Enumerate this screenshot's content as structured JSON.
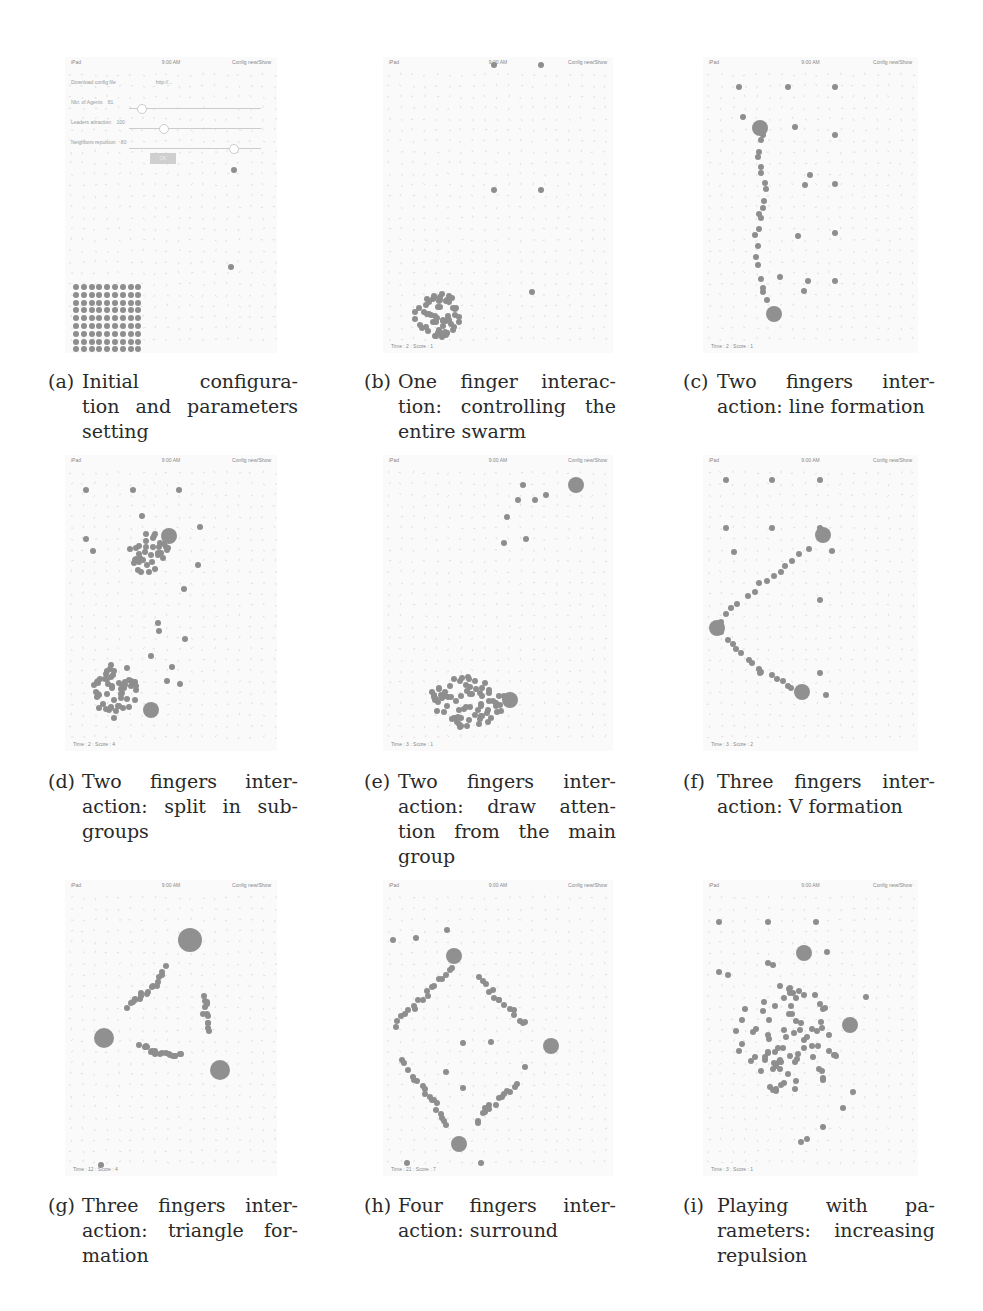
{
  "figure": {
    "panels": [
      {
        "id": "a",
        "label": "(a)",
        "caption": "Initial configuration and parameters setting",
        "caption_lines": [
          "Initial configura-",
          "tion and parameters",
          "setting"
        ],
        "status": {
          "left": "iPad",
          "center": "9:00 AM",
          "right": "Config new/Show"
        },
        "footer": "",
        "form": {
          "rows": [
            "Download config file",
            "Nbr. of Agents",
            "Leaders attraction",
            "Neighbors repulsion"
          ],
          "url": "http://...",
          "values": [
            "81",
            "100",
            "80"
          ],
          "ok_label": "OK"
        },
        "dots": [
          [
            169,
            113
          ],
          [
            166,
            210
          ]
        ],
        "grid": {
          "x": 8,
          "y": 227,
          "cols": 9,
          "rows": 9,
          "step": 7.8
        }
      },
      {
        "id": "b",
        "label": "(b)",
        "caption": "One finger interaction: controlling the entire swarm",
        "caption_lines": [
          "One finger interac-",
          "tion: controlling the",
          "entire swarm"
        ],
        "status": {
          "left": "iPad",
          "center": "9:00 AM",
          "right": "Config new/Show"
        },
        "footer": "Time : 2 : Score : 1",
        "dots": [
          [
            111,
            8
          ],
          [
            158,
            8
          ],
          [
            111,
            133
          ],
          [
            158,
            133
          ],
          [
            149,
            235
          ]
        ],
        "cluster": {
          "cx": 55,
          "cy": 258,
          "rx": 24,
          "ry": 22,
          "n": 60
        }
      },
      {
        "id": "c",
        "label": "(c)",
        "caption": "Two fingers interaction: line formation",
        "caption_lines": [
          "Two fingers inter-",
          "action: line formation"
        ],
        "status": {
          "left": "iPad",
          "center": "9:00 AM",
          "right": "Config new/Show"
        },
        "footer": "Time : 2 : Score : 1",
        "dots": [
          [
            36,
            30
          ],
          [
            85,
            30
          ],
          [
            132,
            30
          ],
          [
            40,
            60
          ],
          [
            92,
            70
          ],
          [
            132,
            78
          ],
          [
            107,
            118
          ],
          [
            132,
            127
          ],
          [
            102,
            128
          ],
          [
            95,
            179
          ],
          [
            132,
            176
          ],
          [
            77,
            220
          ],
          [
            105,
            224
          ],
          [
            132,
            224
          ],
          [
            101,
            234
          ]
        ],
        "big": [
          [
            57,
            71,
            8
          ],
          [
            71,
            257,
            8
          ]
        ],
        "line": [
          [
            58,
            78
          ],
          [
            56,
            100
          ],
          [
            62,
            125
          ],
          [
            58,
            150
          ],
          [
            54,
            170
          ],
          [
            52,
            200
          ],
          [
            58,
            230
          ],
          [
            68,
            252
          ]
        ]
      },
      {
        "id": "d",
        "label": "(d)",
        "caption": "Two fingers interaction: split in subgroups",
        "caption_lines": [
          "Two fingers inter-",
          "action: split in sub-",
          "groups"
        ],
        "status": {
          "left": "iPad",
          "center": "9:00 AM",
          "right": "Config new/Show"
        },
        "footer": "Time : 2 : Score : 4",
        "dots": [
          [
            21,
            35
          ],
          [
            68,
            35
          ],
          [
            114,
            35
          ],
          [
            77,
            61
          ],
          [
            135,
            72
          ],
          [
            21,
            84
          ],
          [
            28,
            96
          ],
          [
            133,
            110
          ],
          [
            119,
            134
          ],
          [
            93,
            168
          ],
          [
            94,
            176
          ],
          [
            120,
            184
          ],
          [
            86,
            201
          ],
          [
            107,
            212
          ],
          [
            102,
            226
          ],
          [
            115,
            229
          ]
        ],
        "big": [
          [
            104,
            81,
            8
          ],
          [
            86,
            255,
            8
          ]
        ],
        "clusters": [
          {
            "cx": 85,
            "cy": 98,
            "rx": 20,
            "ry": 22,
            "n": 35
          },
          {
            "cx": 50,
            "cy": 235,
            "rx": 22,
            "ry": 30,
            "n": 55
          }
        ]
      },
      {
        "id": "e",
        "label": "(e)",
        "caption": "Two fingers interaction: draw attention from the main group",
        "caption_lines": [
          "Two fingers inter-",
          "action: draw atten-",
          "tion from the main",
          "group"
        ],
        "status": {
          "left": "iPad",
          "center": "9:00 AM",
          "right": "Config new/Show"
        },
        "footer": "Time : 3 : Score : 1",
        "dots": [
          [
            135,
            45
          ],
          [
            152,
            45
          ],
          [
            163,
            40
          ],
          [
            140,
            30
          ],
          [
            124,
            62
          ],
          [
            121,
            88
          ],
          [
            143,
            84
          ]
        ],
        "big": [
          [
            193,
            30,
            8
          ],
          [
            127,
            245,
            8
          ]
        ],
        "cluster": {
          "cx": 85,
          "cy": 245,
          "rx": 38,
          "ry": 28,
          "n": 75
        }
      },
      {
        "id": "f",
        "label": "(f)",
        "caption": "Three fingers interaction: V formation",
        "caption_lines": [
          "Three fingers inter-",
          "action: V formation"
        ],
        "status": {
          "left": "iPad",
          "center": "9:00 AM",
          "right": "Config new/Show"
        },
        "footer": "Time : 3 : Score : 2",
        "dots": [
          [
            23,
            25
          ],
          [
            69,
            25
          ],
          [
            117,
            25
          ],
          [
            23,
            73
          ],
          [
            69,
            73
          ],
          [
            117,
            73
          ],
          [
            31,
            97
          ],
          [
            117,
            145
          ],
          [
            129,
            96
          ],
          [
            57,
            218
          ],
          [
            123,
            240
          ],
          [
            117,
            218
          ]
        ],
        "big": [
          [
            120,
            80,
            8
          ],
          [
            14,
            173,
            8
          ],
          [
            99,
            237,
            8
          ]
        ],
        "line": [
          [
            14,
            173
          ],
          [
            30,
            155
          ],
          [
            50,
            135
          ],
          [
            70,
            120
          ],
          [
            90,
            105
          ],
          [
            112,
            88
          ]
        ],
        "line2": [
          [
            14,
            173
          ],
          [
            30,
            190
          ],
          [
            45,
            205
          ],
          [
            60,
            218
          ],
          [
            80,
            228
          ],
          [
            95,
            235
          ]
        ]
      },
      {
        "id": "g",
        "label": "(g)",
        "caption": "Three fingers interaction: triangle formation",
        "caption_lines": [
          "Three fingers inter-",
          "action: triangle for-",
          "mation"
        ],
        "status": {
          "left": "iPad",
          "center": "9:00 AM",
          "right": "Config new/Show"
        },
        "footer": "Time : 12 : Score : 4",
        "dots": [
          [
            36,
            285
          ]
        ],
        "big": [
          [
            125,
            60,
            12
          ],
          [
            39,
            158,
            10
          ],
          [
            155,
            190,
            10
          ]
        ],
        "line": [
          [
            100,
            87
          ],
          [
            95,
            98
          ],
          [
            88,
            107
          ],
          [
            80,
            113
          ],
          [
            75,
            118
          ],
          [
            68,
            122
          ],
          [
            62,
            128
          ]
        ],
        "line2": [
          [
            138,
            118
          ],
          [
            140,
            126
          ],
          [
            141,
            136
          ],
          [
            142,
            144
          ],
          [
            146,
            151
          ]
        ],
        "line3": [
          [
            76,
            166
          ],
          [
            84,
            168
          ],
          [
            90,
            171
          ],
          [
            97,
            174
          ],
          [
            105,
            175
          ],
          [
            112,
            175
          ],
          [
            120,
            177
          ]
        ]
      },
      {
        "id": "h",
        "label": "(h)",
        "caption": "Four fingers interaction: surround",
        "caption_lines": [
          "Four fingers inter-",
          "action: surround"
        ],
        "status": {
          "left": "iPad",
          "center": "9:00 AM",
          "right": "Config new/Show"
        },
        "footer": "Time : 21 : Score : 7",
        "dots": [
          [
            10,
            60
          ],
          [
            33,
            58
          ],
          [
            64,
            50
          ],
          [
            80,
            163
          ],
          [
            108,
            162
          ],
          [
            63,
            192
          ],
          [
            80,
            208
          ],
          [
            98,
            283
          ],
          [
            24,
            283
          ],
          [
            142,
            187
          ]
        ],
        "big": [
          [
            71,
            76,
            8
          ],
          [
            168,
            166,
            8
          ],
          [
            76,
            264,
            8
          ]
        ],
        "line": [
          [
            68,
            88
          ],
          [
            60,
            98
          ],
          [
            50,
            108
          ],
          [
            40,
            118
          ],
          [
            30,
            128
          ],
          [
            20,
            138
          ],
          [
            8,
            150
          ]
        ],
        "line2": [
          [
            97,
            98
          ],
          [
            105,
            110
          ],
          [
            115,
            118
          ],
          [
            125,
            128
          ],
          [
            138,
            140
          ],
          [
            145,
            143
          ]
        ],
        "line3": [
          [
            20,
            180
          ],
          [
            30,
            195
          ],
          [
            38,
            205
          ],
          [
            45,
            215
          ],
          [
            52,
            225
          ],
          [
            60,
            238
          ],
          [
            66,
            250
          ]
        ],
        "line4": [
          [
            135,
            205
          ],
          [
            125,
            213
          ],
          [
            115,
            220
          ],
          [
            105,
            228
          ],
          [
            100,
            235
          ],
          [
            90,
            248
          ]
        ]
      },
      {
        "id": "i",
        "label": "(i)",
        "caption": "Playing with parameters: increasing repulsion",
        "caption_lines": [
          "Playing with pa-",
          "rameters: increasing",
          "repulsion"
        ],
        "status": {
          "left": "iPad",
          "center": "9:00 AM",
          "right": "Config new/Show"
        },
        "footer": "Time : 3 : Score : 1",
        "dots": [
          [
            16,
            42
          ],
          [
            65,
            42
          ],
          [
            113,
            42
          ],
          [
            124,
            72
          ],
          [
            65,
            83
          ],
          [
            70,
            85
          ],
          [
            16,
            92
          ],
          [
            25,
            95
          ],
          [
            163,
            117
          ],
          [
            150,
            212
          ],
          [
            140,
            228
          ],
          [
            120,
            247
          ],
          [
            98,
            262
          ],
          [
            104,
            259
          ]
        ],
        "big": [
          [
            101,
            73,
            8
          ],
          [
            147,
            145,
            8
          ]
        ],
        "cluster": {
          "cx": 85,
          "cy": 160,
          "rx": 55,
          "ry": 55,
          "n": 85
        }
      }
    ]
  },
  "layout": {
    "panel_rects": [
      [
        65,
        57,
        212,
        296
      ],
      [
        383,
        57,
        230,
        296
      ],
      [
        703,
        57,
        215,
        296
      ],
      [
        65,
        455,
        212,
        296
      ],
      [
        383,
        455,
        230,
        296
      ],
      [
        703,
        455,
        215,
        296
      ],
      [
        65,
        880,
        212,
        296
      ],
      [
        383,
        880,
        230,
        296
      ],
      [
        703,
        880,
        215,
        296
      ]
    ],
    "caption_rects": [
      [
        48,
        369,
        250
      ],
      [
        364,
        369,
        252
      ],
      [
        683,
        369,
        252
      ],
      [
        48,
        769,
        250
      ],
      [
        364,
        769,
        252
      ],
      [
        683,
        769,
        252
      ],
      [
        48,
        1193,
        250
      ],
      [
        364,
        1193,
        252
      ],
      [
        683,
        1193,
        252
      ]
    ]
  }
}
